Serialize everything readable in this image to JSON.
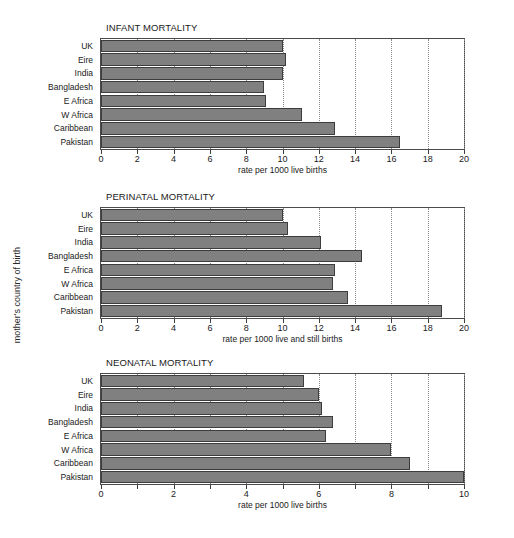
{
  "figure": {
    "ylabel": "mother's country of birth",
    "bar_color": "#808080",
    "bar_edge_color": "#3d3d3d",
    "axis_color": "#4a4a4a",
    "grid_color": "#8a8a8a",
    "background": "#ffffff"
  },
  "chart_data": [
    {
      "type": "bar",
      "orientation": "horizontal",
      "title": "INFANT MORTALITY",
      "xlabel": "rate per 1000 live births",
      "ylabel": "mother's country of birth",
      "categories": [
        "UK",
        "Eire",
        "India",
        "Bangladesh",
        "E Africa",
        "W Africa",
        "Caribbean",
        "Pakistan"
      ],
      "values": [
        10.0,
        10.2,
        10.0,
        9.0,
        9.1,
        11.1,
        12.9,
        16.5
      ],
      "xlim": [
        0,
        20
      ],
      "xticks": [
        0,
        2,
        4,
        6,
        8,
        10,
        12,
        14,
        16,
        18,
        20
      ],
      "xticklabels": [
        "0",
        "2",
        "4",
        "6",
        "8",
        "10",
        "12",
        "14",
        "16",
        "18",
        "20"
      ],
      "grid": true,
      "legend": false
    },
    {
      "type": "bar",
      "orientation": "horizontal",
      "title": "PERINATAL MORTALITY",
      "xlabel": "rate per 1000 live and still births",
      "ylabel": "mother's country of birth",
      "categories": [
        "UK",
        "Eire",
        "India",
        "Bangladesh",
        "E Africa",
        "W Africa",
        "Caribbean",
        "Pakistan"
      ],
      "values": [
        10.0,
        10.3,
        12.1,
        14.4,
        12.9,
        12.8,
        13.6,
        18.8
      ],
      "xlim": [
        0,
        20
      ],
      "xticks": [
        0,
        2,
        4,
        6,
        8,
        10,
        12,
        14,
        16,
        18,
        20
      ],
      "xticklabels": [
        "0",
        "2",
        "4",
        "6",
        "8",
        "10",
        "12",
        "14",
        "16",
        "18",
        "20"
      ],
      "grid": true,
      "legend": false
    },
    {
      "type": "bar",
      "orientation": "horizontal",
      "title": "NEONATAL MORTALITY",
      "xlabel": "rate per 1000 live births",
      "ylabel": "mother's country of birth",
      "categories": [
        "UK",
        "Eire",
        "India",
        "Bangladesh",
        "E Africa",
        "W Africa",
        "Caribbean",
        "Pakistan"
      ],
      "values": [
        5.6,
        6.0,
        6.1,
        6.4,
        6.2,
        8.0,
        8.5,
        10.0
      ],
      "xlim": [
        0,
        10
      ],
      "xticks": [
        0,
        1,
        2,
        3,
        4,
        5,
        6,
        7,
        8,
        9,
        10
      ],
      "xticklabels": [
        "0",
        "",
        "2",
        "",
        "4",
        "",
        "6",
        "",
        "8",
        "",
        "10"
      ],
      "grid": true,
      "legend": false
    }
  ]
}
